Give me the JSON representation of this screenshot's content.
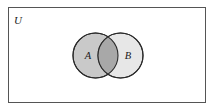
{
  "figure": {
    "type": "venn-diagram",
    "title_text": "",
    "background_color": "#ffffff",
    "universe": {
      "label": "U",
      "border_color": "#555555",
      "fill_color": "#ffffff",
      "x": 8,
      "y": 7,
      "width": 197,
      "height": 95,
      "label_x": 14,
      "label_y": 24
    },
    "sets": [
      {
        "label": "A",
        "fill_color": "#c9c9c9",
        "stroke_color": "#2b2b2b",
        "cx": 95.5,
        "cy": 55.5,
        "r": 22.5,
        "label_x": 88,
        "label_y": 59
      },
      {
        "label": "B",
        "fill_color": "#e7e7e7",
        "stroke_color": "#2b2b2b",
        "cx": 120.5,
        "cy": 55.5,
        "r": 22.5,
        "label_x": 124,
        "label_y": 59
      }
    ],
    "intersection": {
      "label": "",
      "fill_color": "#a8a8a8",
      "description": "A intersect B"
    }
  }
}
